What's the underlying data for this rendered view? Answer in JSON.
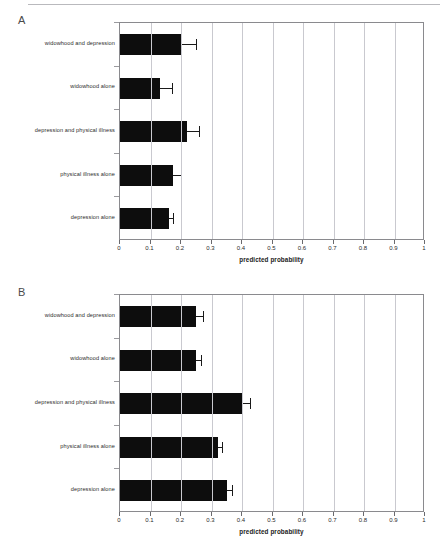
{
  "figure": {
    "panels": [
      {
        "letter": "A",
        "id": "panel-a"
      },
      {
        "letter": "B",
        "id": "panel-b"
      }
    ],
    "axis_title": "predicted probability",
    "x_tick_labels": [
      "0",
      "0.1",
      "0.2",
      "0.3",
      "0.4",
      "0.5",
      "0.6",
      "0.7",
      "0.8",
      "0.9",
      "1"
    ],
    "categories": [
      "widowhood and depression",
      "widowhood alone",
      "depression and physical illness",
      "physical illness alone",
      "depression alone"
    ]
  },
  "chart_data": [
    {
      "type": "bar",
      "orientation": "horizontal",
      "panel": "A",
      "title": "A",
      "xlabel": "predicted probability",
      "ylabel": "",
      "xlim": [
        0,
        1
      ],
      "xticks": [
        0,
        0.1,
        0.2,
        0.3,
        0.4,
        0.5,
        0.6,
        0.7,
        0.8,
        0.9,
        1
      ],
      "grid": "vertical",
      "legend": "none",
      "bar_color": "#0d0d0d",
      "categories": [
        "widowhood and depression",
        "widowhood alone",
        "depression and physical illness",
        "physical illness alone",
        "depression alone"
      ],
      "values": [
        0.2,
        0.13,
        0.22,
        0.175,
        0.16
      ],
      "error_upper": [
        0.25,
        0.17,
        0.26,
        0.2,
        0.175
      ]
    },
    {
      "type": "bar",
      "orientation": "horizontal",
      "panel": "B",
      "title": "B",
      "xlabel": "predicted probability",
      "ylabel": "",
      "xlim": [
        0,
        1
      ],
      "xticks": [
        0,
        0.1,
        0.2,
        0.3,
        0.4,
        0.5,
        0.6,
        0.7,
        0.8,
        0.9,
        1
      ],
      "grid": "vertical",
      "legend": "none",
      "bar_color": "#0d0d0d",
      "categories": [
        "widowhood and depression",
        "widowhood alone",
        "depression and physical illness",
        "physical illness alone",
        "depression alone"
      ],
      "values": [
        0.25,
        0.25,
        0.4,
        0.32,
        0.35
      ],
      "error_upper": [
        0.272,
        0.265,
        0.425,
        0.336,
        0.366
      ]
    }
  ]
}
